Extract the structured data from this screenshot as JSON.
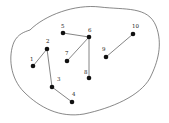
{
  "diagram": {
    "type": "graph",
    "nodes": [
      {
        "id": "1",
        "label": "1"
      },
      {
        "id": "2",
        "label": "2"
      },
      {
        "id": "3",
        "label": "3"
      },
      {
        "id": "4",
        "label": "4"
      },
      {
        "id": "5",
        "label": "5"
      },
      {
        "id": "6",
        "label": "6"
      },
      {
        "id": "7",
        "label": "7"
      },
      {
        "id": "8",
        "label": "8"
      },
      {
        "id": "9",
        "label": "9"
      },
      {
        "id": "10",
        "label": "10"
      }
    ],
    "edges": [
      [
        "1",
        "2"
      ],
      [
        "2",
        "3"
      ],
      [
        "3",
        "4"
      ],
      [
        "5",
        "6"
      ],
      [
        "6",
        "7"
      ],
      [
        "6",
        "8"
      ],
      [
        "9",
        "10"
      ]
    ],
    "colors": {
      "node": "#111111",
      "edge": "#666666",
      "boundary": "#555555"
    }
  }
}
